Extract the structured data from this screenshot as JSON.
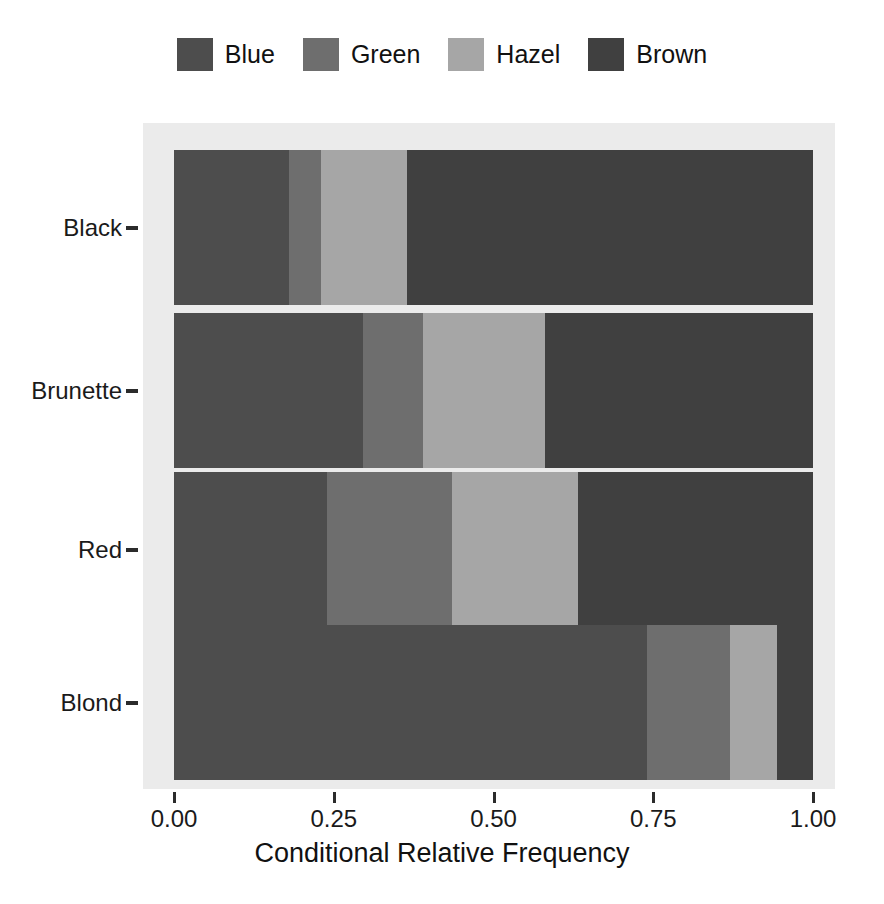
{
  "chart_data": {
    "type": "bar",
    "orientation": "horizontal",
    "stacked": true,
    "normalized": true,
    "title": "",
    "xlabel": "Conditional Relative Frequency",
    "ylabel": "",
    "xlim": [
      0.0,
      1.0
    ],
    "xticks": [
      "0.00",
      "0.25",
      "0.50",
      "0.75",
      "1.00"
    ],
    "xtick_values": [
      0.0,
      0.25,
      0.5,
      0.75,
      1.0
    ],
    "grid": false,
    "legend_position": "top",
    "categories": [
      "Black",
      "Brunette",
      "Red",
      "Blond"
    ],
    "series": [
      {
        "name": "Blue",
        "color": "#4d4d4d",
        "values": [
          0.18,
          0.295,
          0.24,
          0.74
        ]
      },
      {
        "name": "Green",
        "color": "#6e6e6e",
        "values": [
          0.05,
          0.095,
          0.195,
          0.13
        ]
      },
      {
        "name": "Hazel",
        "color": "#a6a6a6",
        "values": [
          0.135,
          0.19,
          0.197,
          0.073
        ]
      },
      {
        "name": "Brown",
        "color": "#404040",
        "values": [
          0.635,
          0.42,
          0.368,
          0.057
        ]
      }
    ],
    "panel_background": "#ebebeb",
    "page_background": "#ffffff"
  },
  "legend": {
    "items": [
      {
        "label": "Blue",
        "color": "#4d4d4d"
      },
      {
        "label": "Green",
        "color": "#6e6e6e"
      },
      {
        "label": "Hazel",
        "color": "#a6a6a6"
      },
      {
        "label": "Brown",
        "color": "#404040"
      }
    ]
  },
  "axes": {
    "x": {
      "title": "Conditional Relative Frequency",
      "ticks": [
        "0.00",
        "0.25",
        "0.50",
        "0.75",
        "1.00"
      ]
    },
    "y": {
      "ticks": [
        "Black",
        "Brunette",
        "Red",
        "Blond"
      ]
    }
  }
}
